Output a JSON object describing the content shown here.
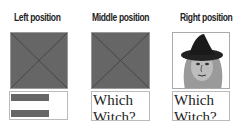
{
  "columns": [
    {
      "label": "Left position",
      "image": "placeholder-x",
      "text": null
    },
    {
      "label": "Middle position",
      "image": "placeholder-x",
      "text": "Which Witch?"
    },
    {
      "label": "Right position",
      "image": "witch-illustration",
      "text": "Which Witch?"
    }
  ],
  "texts": {
    "line1": "Which",
    "line2": "Witch?"
  }
}
